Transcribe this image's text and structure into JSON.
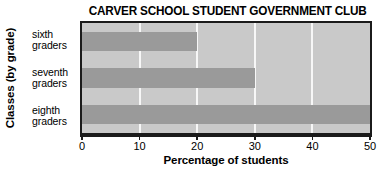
{
  "chart_data": {
    "type": "bar",
    "orientation": "horizontal",
    "title": "CARVER SCHOOL STUDENT GOVERNMENT CLUB",
    "xlabel": "Percentage of students",
    "ylabel": "Classes (by grade)",
    "categories": [
      "sixth graders",
      "seventh graders",
      "eighth graders"
    ],
    "category_lines": [
      [
        "sixth",
        "graders"
      ],
      [
        "seventh",
        "graders"
      ],
      [
        "eighth",
        "graders"
      ]
    ],
    "values": [
      20,
      30,
      50
    ],
    "xlim": [
      0,
      50
    ],
    "xticks": [
      0,
      10,
      20,
      30,
      40,
      50
    ],
    "xtick_labels": [
      "0",
      "10",
      "20",
      "30",
      "40",
      "50"
    ],
    "grid": true,
    "grid_axis": "x",
    "legend": null,
    "colors": {
      "bar": "#9a9a9a",
      "plot_background": "#c9c9c9",
      "gridline": "#f7f7f7",
      "axis": "#1b1b1b",
      "text": "#000000"
    }
  }
}
